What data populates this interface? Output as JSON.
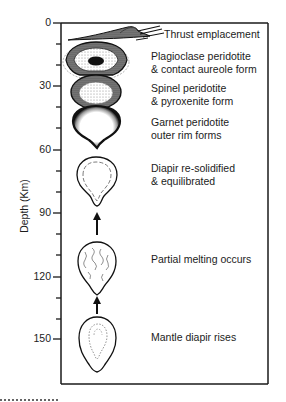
{
  "figure": {
    "y_axis": {
      "label": "Depth (Km)",
      "ticks": [
        "0",
        "30",
        "60",
        "90",
        "120",
        "150"
      ]
    },
    "stages": [
      {
        "id": "thrust",
        "line1": "Thrust emplacement",
        "line2": ""
      },
      {
        "id": "plagioclase",
        "line1": "Plagioclase peridotite",
        "line2": "& contact aureole form"
      },
      {
        "id": "spinel",
        "line1": "Spinel peridotite",
        "line2": "& pyroxenite form"
      },
      {
        "id": "garnet",
        "line1": "Garnet peridotite",
        "line2": "outer rim forms"
      },
      {
        "id": "resolidified",
        "line1": "Diapir re-solidified",
        "line2": "& equilibrated"
      },
      {
        "id": "partial-melting",
        "line1": "Partial melting occurs",
        "line2": ""
      },
      {
        "id": "rises",
        "line1": "Mantle diapir rises",
        "line2": ""
      }
    ],
    "colors": {
      "ink": "#1a1a1a",
      "background": "#ffffff",
      "stipple": "#6a6a6a"
    }
  }
}
